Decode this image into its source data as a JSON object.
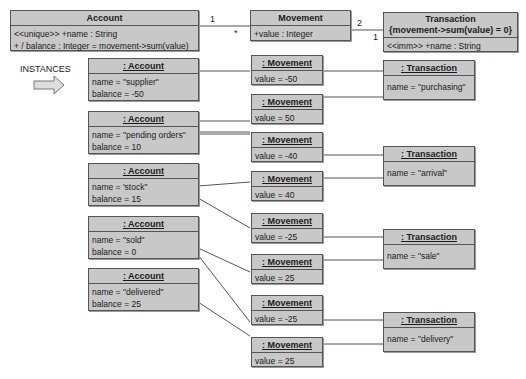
{
  "classes": {
    "account": {
      "name": "Account",
      "attrs": [
        "<<unique>> +name : String",
        "+ / balance : Integer = movement->sum(value)"
      ]
    },
    "movement": {
      "name": "Movement",
      "attrs": [
        "+value : Integer"
      ]
    },
    "transaction": {
      "name": "Transaction",
      "constraint": "{movement->sum(value) = 0}",
      "attrs": [
        "<<imm>> +name : String"
      ]
    }
  },
  "multiplicities": {
    "acc_mov_1": "1",
    "acc_mov_star": "*",
    "mov_tx_2": "2",
    "mov_tx_1": "1"
  },
  "instances_label": "INSTANCES",
  "accounts": [
    {
      "title": ": Account",
      "name": "name = \"supplier\"",
      "balance": "balance = -50"
    },
    {
      "title": ": Account",
      "name": "name = \"pending orders\"",
      "balance": "balance = 10"
    },
    {
      "title": ": Account",
      "name": "name = 'stock\"",
      "balance": "balance = 15"
    },
    {
      "title": ": Account",
      "name": "name = \"sold\"",
      "balance": "balance = 0"
    },
    {
      "title": ": Account",
      "name": "name = \"delivered\"",
      "balance": "balance = 25"
    }
  ],
  "movements": [
    {
      "title": ": Movement",
      "value": "value = -50"
    },
    {
      "title": ": Movement",
      "value": "value = 50"
    },
    {
      "title": ": Movement",
      "value": "value = -40"
    },
    {
      "title": ": Movement",
      "value": "value = 40"
    },
    {
      "title": ": Movement",
      "value": "value = -25"
    },
    {
      "title": ": Movement",
      "value": "value = 25"
    },
    {
      "title": ": Movement",
      "value": "value = -25"
    },
    {
      "title": ": Movement",
      "value": "value = 25"
    }
  ],
  "transactions": [
    {
      "title": ": Transaction",
      "name": "name = \"purchasing\""
    },
    {
      "title": ": Transaction",
      "name": "name = \"arrival\""
    },
    {
      "title": ": Transaction",
      "name": "name = \"sale\""
    },
    {
      "title": ": Transaction",
      "name": "name = \"delivery\""
    }
  ]
}
